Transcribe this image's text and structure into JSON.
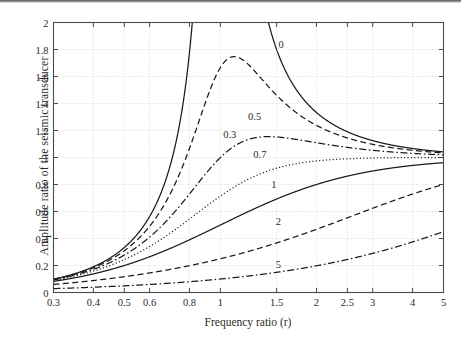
{
  "figure": {
    "caption_none": "",
    "y_axis_title": "Amplitude ratio of the seismic transducer",
    "x_axis_title": "Frequency ratio (r)"
  },
  "chart_data": {
    "type": "line",
    "title": "",
    "xlabel": "Frequency ratio (r)",
    "ylabel": "Amplitude ratio of the seismic transducer",
    "xscale": "log",
    "yscale": "linear",
    "xlim": [
      0.3,
      5
    ],
    "ylim": [
      0,
      2
    ],
    "grid": true,
    "legend_position": "inline-curve-labels",
    "xticks": [
      0.3,
      0.4,
      0.5,
      0.6,
      0.8,
      1,
      1.5,
      2,
      2.5,
      3,
      4,
      5
    ],
    "xtick_labels": [
      "0.3",
      "0.4",
      "0.5",
      "0.6",
      "0.8",
      "1",
      "1.5",
      "2",
      "2.5",
      "3",
      "4",
      "5"
    ],
    "yticks": [
      0,
      0.2,
      0.4,
      0.6,
      0.8,
      1,
      1.2,
      1.4,
      1.6,
      1.8,
      2
    ],
    "ytick_labels": [
      "0",
      "0.2",
      "0.4",
      "0.6",
      "0.8",
      "1",
      "1.2",
      "1.4",
      "1.6",
      "1.8",
      "2"
    ],
    "formula": "r^2 / sqrt((1 - r^2)^2 + (2*zeta*r)^2)",
    "series": [
      {
        "name": "0",
        "zeta": 0,
        "style": "solid",
        "label_text": "0",
        "label_at": {
          "r": 1.55,
          "y": 1.83
        },
        "x": [
          0.3,
          0.4,
          0.5,
          0.6,
          0.7,
          0.8,
          0.9,
          0.95,
          1.05,
          1.1,
          1.2,
          1.3,
          1.5,
          1.75,
          2,
          2.5,
          3,
          4,
          5
        ],
        "values": [
          0.0989,
          0.1905,
          0.3333,
          0.5625,
          0.9608,
          1.7778,
          4.2632,
          9.2564,
          10.268,
          4.7619,
          2.2727,
          1.5327,
          1.2,
          1.0723,
          1.0455,
          1.1905,
          1.125,
          1.0667,
          1.0417
        ]
      },
      {
        "name": "0.3",
        "zeta": 0.3,
        "style": "dashed",
        "label_text": "0.3",
        "label_at": {
          "r": 1.07,
          "y": 1.17
        },
        "peak": {
          "r": 1.1,
          "y": 1.75
        },
        "x": [
          0.3,
          0.4,
          0.5,
          0.6,
          0.7,
          0.8,
          0.9,
          1.0,
          1.1,
          1.2,
          1.3,
          1.5,
          1.75,
          2,
          2.5,
          3,
          4,
          5
        ],
        "values": [
          0.0982,
          0.1882,
          0.3252,
          0.5377,
          0.8427,
          1.2309,
          1.591,
          1.6667,
          1.7473,
          1.549,
          1.3719,
          1.1752,
          1.0883,
          1.0583,
          1.0344,
          1.024,
          1.0139,
          1.009
        ]
      },
      {
        "name": "0.5",
        "zeta": 0.5,
        "style": "dashdot",
        "label_text": "0.5",
        "label_at": {
          "r": 1.28,
          "y": 1.3
        },
        "peak": {
          "r": 1.42,
          "y": 1.16
        },
        "x": [
          0.3,
          0.4,
          0.5,
          0.6,
          0.7,
          0.8,
          0.9,
          1.0,
          1.2,
          1.4,
          1.5,
          1.75,
          2,
          2.5,
          3,
          4,
          5
        ],
        "values": [
          0.0974,
          0.1848,
          0.3123,
          0.4961,
          0.7203,
          0.9412,
          1.0806,
          1.0,
          1.1538,
          1.1564,
          1.1447,
          1.1028,
          1.0667,
          1.0259,
          1.0094,
          1.0,
          0.999
        ]
      },
      {
        "name": "0.7",
        "zeta": 0.7,
        "style": "dotted",
        "label_text": "0.7",
        "label_at": {
          "r": 1.33,
          "y": 1.02
        },
        "x": [
          0.3,
          0.4,
          0.5,
          0.6,
          0.7,
          0.8,
          0.9,
          1.0,
          1.2,
          1.4,
          1.75,
          2,
          2.5,
          3,
          4,
          5
        ],
        "values": [
          0.0962,
          0.1798,
          0.2955,
          0.4472,
          0.6211,
          0.7843,
          0.8975,
          0.7143,
          0.944,
          0.9851,
          1.0116,
          1.0092,
          0.9959,
          0.9867,
          0.979,
          0.9761
        ]
      },
      {
        "name": "1",
        "zeta": 1,
        "style": "solid",
        "label_text": "1",
        "label_at": {
          "r": 1.47,
          "y": 0.8
        },
        "x": [
          0.3,
          0.4,
          0.5,
          0.6,
          0.7,
          0.8,
          0.9,
          1.0,
          1.2,
          1.5,
          1.75,
          2,
          2.5,
          3,
          4,
          5
        ],
        "values": [
          0.084,
          0.1633,
          0.25,
          0.3516,
          0.4498,
          0.5432,
          0.6282,
          0.5,
          0.7563,
          0.832,
          0.8772,
          0.8889,
          0.9184,
          0.9375,
          0.96,
          0.9722
        ]
      },
      {
        "name": "2",
        "zeta": 2,
        "style": "dashed",
        "label_text": "2",
        "label_at": {
          "r": 1.52,
          "y": 0.52
        },
        "x": [
          0.3,
          0.4,
          0.5,
          0.6,
          0.8,
          1.0,
          1.2,
          1.5,
          2,
          2.5,
          3,
          4,
          5
        ],
        "values": [
          0.0725,
          0.123,
          0.189,
          0.2621,
          0.412,
          0.25,
          0.6429,
          0.4615,
          0.6202,
          0.6944,
          0.75,
          0.8247,
          0.8696
        ]
      },
      {
        "name": "5",
        "zeta": 5,
        "style": "dashdot",
        "label_text": "5",
        "label_at": {
          "r": 1.52,
          "y": 0.205
        },
        "x": [
          0.3,
          0.4,
          0.5,
          0.6,
          0.8,
          1.0,
          1.5,
          2,
          2.5,
          3,
          4,
          5
        ],
        "values": [
          0.0297,
          0.0524,
          0.0801,
          0.1121,
          0.1876,
          0.1,
          0.2857,
          0.2425,
          0.308,
          0.3612,
          0.4417,
          0.5
        ]
      }
    ]
  }
}
